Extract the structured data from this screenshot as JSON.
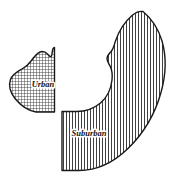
{
  "figure": {
    "background_color": "#ffffff",
    "outline_color": "#1a1a1a",
    "canvas": {
      "width": 173,
      "height": 180
    }
  },
  "regions": [
    {
      "id": "urban",
      "label": "Urban",
      "fill_pattern": "cross-hatch",
      "pattern_spacing_px": 3,
      "pattern_color": "#2b2b2b",
      "label_position": {
        "x": 43,
        "y": 85
      },
      "label_font_size_px": 8.5,
      "outline_color": "#1a1a1a",
      "outline_width_px": 1.4,
      "path": "M 54.5 47.5 L 54.5 112.0 L 36.0 112.0 C 28.0 110.5 20.5 105.5 15.0 98.5 C 10.0 92.0 8.5 85.0 10.5 79.5 C 12.5 74.0 17.5 71.5 22.0 69.0 C 26.0 66.8 29.0 64.0 31.5 60.5 C 34.0 57.0 36.5 53.5 40.0 52.0 C 43.0 50.7 45.5 52.0 47.5 54.0 C 49.0 55.5 50.0 57.0 51.0 56.5 C 52.0 56.0 52.0 53.0 52.5 50.5 C 53.0 48.2 53.6 47.5 54.5 47.5 Z"
    },
    {
      "id": "suburban",
      "label": "Suburban",
      "fill_pattern": "vertical-lines",
      "pattern_spacing_px": 3,
      "pattern_color": "#2b2b2b",
      "label_position": {
        "x": 89,
        "y": 134
      },
      "label_font_size_px": 8.5,
      "outline_color": "#1a1a1a",
      "outline_width_px": 1.4,
      "path": "M 143.0 11.5 C 152.0 19.0 158.5 29.0 162.0 41.0 C 166.5 56.5 166.0 74.5 161.0 92.5 C 155.0 114.0 143.5 133.5 128.0 148.5 C 113.0 163.0 96.0 170.5 79.0 170.5 L 62.0 170.5 L 62.0 111.5 L 76.5 111.5 C 85.5 111.5 94.0 108.5 100.5 103.0 C 107.5 97.0 111.0 89.0 112.0 80.0 C 112.6 74.5 112.0 70.5 110.5 67.0 C 109.0 63.5 107.0 61.5 107.0 58.5 C 107.0 55.5 109.5 53.5 111.5 51.0 C 113.5 48.5 114.0 45.5 115.5 41.0 C 118.5 32.0 124.0 22.5 132.0 15.5 C 135.5 12.5 139.0 11.0 143.0 11.5 Z"
    }
  ]
}
